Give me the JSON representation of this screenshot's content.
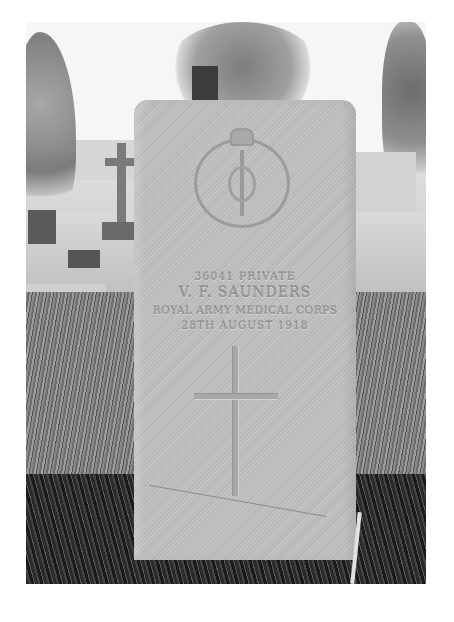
{
  "image": {
    "description": "Black-and-white photograph of a military headstone in a churchyard",
    "headstone": {
      "emblem": "Royal Army Medical Corps badge (crown over wreath with rod of Asclepius)",
      "inscription": {
        "line1": "36041 PRIVATE",
        "line2": "V. F. SAUNDERS",
        "line3": "ROYAL ARMY MEDICAL CORPS",
        "line4": "28TH AUGUST 1918"
      },
      "carving": "cross"
    },
    "background": "churchyard with trees, other headstones, a stone cross and buildings"
  }
}
